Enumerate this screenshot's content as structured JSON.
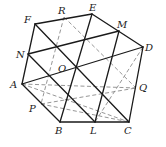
{
  "diagram": {
    "type": "geometry-figure",
    "points": {
      "A": "A",
      "B": "B",
      "C": "C",
      "D": "D",
      "E": "E",
      "F": "F",
      "M": "M",
      "N": "N",
      "O": "O",
      "P": "P",
      "Q": "Q",
      "R": "R",
      "L": "L"
    },
    "solid_segments": [
      [
        "A",
        "B"
      ],
      [
        "B",
        "C"
      ],
      [
        "C",
        "D"
      ],
      [
        "D",
        "E"
      ],
      [
        "E",
        "F"
      ],
      [
        "F",
        "A"
      ],
      [
        "N",
        "M"
      ],
      [
        "A",
        "D"
      ],
      [
        "F",
        "C"
      ],
      [
        "E",
        "B"
      ],
      [
        "M",
        "L"
      ],
      [
        "N",
        "L"
      ]
    ],
    "dashed_segments": [
      [
        "R",
        "P"
      ],
      [
        "R",
        "Q"
      ],
      [
        "D",
        "L"
      ],
      [
        "A",
        "Q"
      ],
      [
        "A",
        "C"
      ],
      [
        "P",
        "Q"
      ],
      [
        "P",
        "C"
      ]
    ],
    "line_colors": {
      "solid": "#1a1a1a",
      "dashed": "#8a8a8a"
    }
  }
}
